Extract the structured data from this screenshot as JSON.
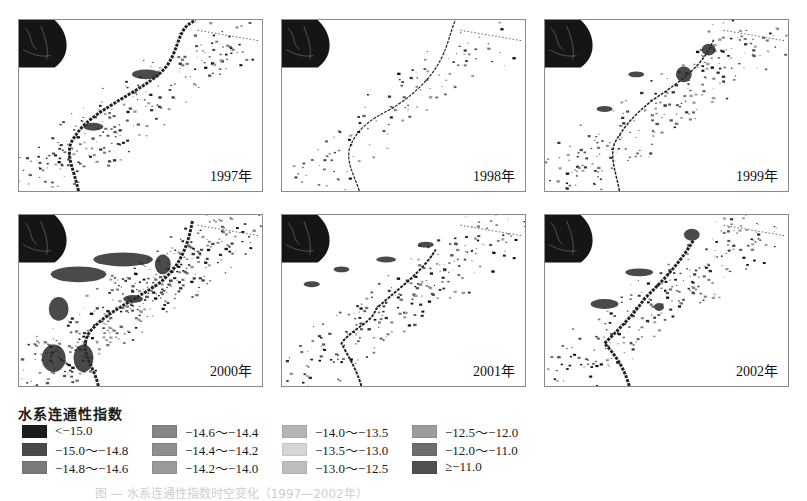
{
  "figure": {
    "panels": [
      {
        "year_label": "1997年",
        "x": 18,
        "y": 19
      },
      {
        "year_label": "1998年",
        "x": 281,
        "y": 19
      },
      {
        "year_label": "1999年",
        "x": 544,
        "y": 19
      },
      {
        "year_label": "2000年",
        "x": 18,
        "y": 214
      },
      {
        "year_label": "2001年",
        "x": 281,
        "y": 214
      },
      {
        "year_label": "2002年",
        "x": 544,
        "y": 214
      }
    ],
    "legend": {
      "title": "水系连通性指数",
      "items": [
        {
          "label": "<−15.0",
          "color": "#1c1c1c"
        },
        {
          "label": "−15.0～−14.8",
          "color": "#4a4a4a"
        },
        {
          "label": "−14.8～−14.6",
          "color": "#7a7a7a"
        },
        {
          "label": "−14.6～−14.4",
          "color": "#858585"
        },
        {
          "label": "−14.4～−14.2",
          "color": "#8e8e8e"
        },
        {
          "label": "−14.2～−14.0",
          "color": "#9a9a9a"
        },
        {
          "label": "−14.0～−13.5",
          "color": "#b5b5b5"
        },
        {
          "label": "−13.5～−13.0",
          "color": "#d6d6d6"
        },
        {
          "label": "−13.0～−12.5",
          "color": "#bdbdbd"
        },
        {
          "label": "−12.5～−12.0",
          "color": "#9c9c9c"
        },
        {
          "label": "−12.0～−11.0",
          "color": "#6e6e6e"
        },
        {
          "label": "≥−11.0",
          "color": "#505050"
        }
      ]
    },
    "caption": "图 — 水系连通性指数时空变化（1997—2002年）"
  }
}
